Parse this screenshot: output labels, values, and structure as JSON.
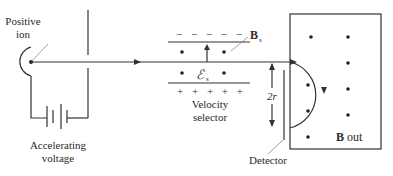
{
  "diagram": {
    "labels": {
      "positive_ion_line1": "Positive",
      "positive_ion_line2": "ion",
      "accelerating_line1": "Accelerating",
      "accelerating_line2": "voltage",
      "velocity_line1": "Velocity",
      "velocity_line2": "selector",
      "field_B": "B",
      "field_B_sub": "s",
      "field_E": "ℰ",
      "field_E_sub": "s",
      "diameter": "2r",
      "detector": "Detector",
      "b_out_bold": "B",
      "b_out_rest": " out"
    },
    "plate_signs": {
      "top": "− − − − −",
      "bottom": "+ + + + +"
    },
    "colors": {
      "line": "#333333",
      "text": "#2a2a2a",
      "background": "#ffffff"
    }
  }
}
